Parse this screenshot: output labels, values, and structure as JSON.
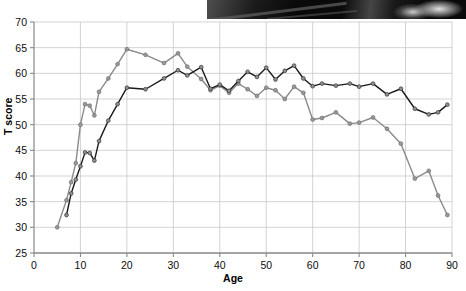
{
  "figure": {
    "photo_strip_present": true,
    "background_color": "#ffffff"
  },
  "chart_data": {
    "type": "line",
    "title": "",
    "xlabel": "Age",
    "ylabel": "T score",
    "xlim": [
      0,
      90
    ],
    "ylim": [
      25,
      70
    ],
    "xticks": [
      0,
      10,
      20,
      30,
      40,
      50,
      60,
      70,
      80,
      90
    ],
    "yticks": [
      25,
      30,
      35,
      40,
      45,
      50,
      55,
      60,
      65,
      70
    ],
    "grid": true,
    "legend": "none",
    "marker": "circle",
    "series": [
      {
        "name": "upper-series",
        "color": "#8a8a8a",
        "marker_fill": "#9a9a9a",
        "marker_edge": "#6e6e6e",
        "x": [
          5,
          7,
          8,
          9,
          10,
          11,
          12,
          13,
          14,
          16,
          18,
          20,
          24,
          28,
          31,
          33,
          36,
          38,
          40,
          42,
          44,
          46,
          48,
          50,
          52,
          54,
          56,
          58,
          60,
          62,
          65,
          68,
          70,
          73,
          76,
          79,
          82,
          85,
          87,
          89
        ],
        "y": [
          30.0,
          35.3,
          38.8,
          42.5,
          50.0,
          54.0,
          53.7,
          51.8,
          56.4,
          59.0,
          61.8,
          64.7,
          63.6,
          62.0,
          63.9,
          61.3,
          58.9,
          56.7,
          57.6,
          56.2,
          58.0,
          56.9,
          55.6,
          57.2,
          56.7,
          55.0,
          57.4,
          56.2,
          51.0,
          51.3,
          52.4,
          50.2,
          50.4,
          51.4,
          49.2,
          46.3,
          39.5,
          41.0,
          36.2,
          32.4
        ]
      },
      {
        "name": "lower-series",
        "color": "#1a1a1a",
        "marker_fill": "#8f8f8f",
        "marker_edge": "#3a3a3a",
        "x": [
          7,
          8,
          9,
          10,
          11,
          12,
          13,
          14,
          16,
          18,
          20,
          24,
          28,
          31,
          33,
          36,
          38,
          40,
          42,
          44,
          46,
          48,
          50,
          52,
          54,
          56,
          58,
          60,
          62,
          65,
          68,
          70,
          73,
          76,
          79,
          82,
          85,
          87,
          89
        ],
        "y": [
          32.4,
          36.6,
          39.3,
          41.9,
          44.6,
          44.5,
          43.0,
          46.8,
          50.8,
          54.0,
          57.2,
          56.9,
          59.0,
          60.6,
          59.6,
          61.2,
          57.0,
          57.8,
          56.6,
          58.5,
          60.3,
          59.3,
          61.1,
          58.8,
          60.5,
          61.5,
          59.0,
          57.5,
          58.0,
          57.6,
          58.0,
          57.4,
          58.0,
          55.9,
          57.0,
          53.1,
          52.0,
          52.4,
          53.9
        ]
      }
    ]
  },
  "axes": {
    "y_title": "T score",
    "x_title": "Age",
    "y_tick_labels": [
      "70",
      "65",
      "60",
      "55",
      "50",
      "45",
      "40",
      "35",
      "30",
      "25"
    ],
    "x_tick_labels": [
      "0",
      "10",
      "20",
      "30",
      "40",
      "50",
      "60",
      "70",
      "80",
      "90"
    ]
  },
  "style": {
    "grid_color": "#c8c8c8",
    "axis_color": "#888888",
    "text_color": "#0d0d0d"
  }
}
